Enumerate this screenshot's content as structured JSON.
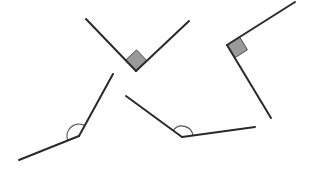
{
  "figure": {
    "width": 311,
    "height": 170,
    "background_color": "#ffffff",
    "stroke_color": "#2a2a2a",
    "stroke_width": 2,
    "marker_fill_color": "#9a9a9a",
    "marker_stroke_color": "#4a4a4a",
    "arc_stroke_color": "#555555",
    "angles": [
      {
        "id": "angle-top-center",
        "label": "top-center-v-angle",
        "marker_type": "right-angle-square",
        "vertex": {
          "x": 136,
          "y": 71
        },
        "ray1_end": {
          "x": 86,
          "y": 19
        },
        "ray2_end": {
          "x": 189,
          "y": 21
        },
        "measure_degrees": 90,
        "marker_size": 15
      },
      {
        "id": "angle-top-right",
        "label": "top-right-angle",
        "marker_type": "right-angle-square",
        "vertex": {
          "x": 227,
          "y": 45
        },
        "ray1_end": {
          "x": 295,
          "y": 2
        },
        "ray2_end": {
          "x": 271,
          "y": 118
        },
        "measure_degrees": 90,
        "marker_size": 15
      },
      {
        "id": "angle-bottom-left",
        "label": "bottom-left-obtuse-angle",
        "marker_type": "arc",
        "vertex": {
          "x": 79,
          "y": 136
        },
        "ray1_end": {
          "x": 113,
          "y": 74
        },
        "ray2_end": {
          "x": 19,
          "y": 160
        },
        "measure_degrees": 130,
        "marker_size": 12
      },
      {
        "id": "angle-bottom-center",
        "label": "bottom-center-obtuse-angle",
        "marker_type": "arc",
        "vertex": {
          "x": 182,
          "y": 137
        },
        "ray1_end": {
          "x": 126,
          "y": 96
        },
        "ray2_end": {
          "x": 255,
          "y": 127
        },
        "measure_degrees": 140,
        "marker_size": 11
      }
    ]
  }
}
